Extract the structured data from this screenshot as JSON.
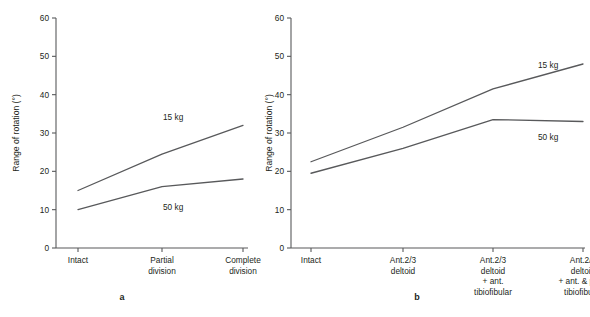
{
  "figure": {
    "panel_a_label": "a",
    "panel_b_label": "b"
  },
  "axes": {
    "ylabel": "Range of rotation (°)",
    "yticks": [
      "0",
      "10",
      "20",
      "30",
      "40",
      "50",
      "60"
    ]
  },
  "chart_data": [
    {
      "type": "line",
      "panel": "a",
      "title": "",
      "xlabel": "",
      "ylabel": "Range of rotation (°)",
      "ylim": [
        0,
        60
      ],
      "yticks": [
        0,
        10,
        20,
        30,
        40,
        50,
        60
      ],
      "grid": false,
      "legend_position": "inline-right",
      "categories": [
        "Intact",
        "Partial division",
        "Complete division"
      ],
      "category_lines": [
        [
          "Intact"
        ],
        [
          "Partial",
          "division"
        ],
        [
          "Complete",
          "division"
        ]
      ],
      "series": [
        {
          "name": "15 kg",
          "values": [
            15,
            24.5,
            32
          ]
        },
        {
          "name": "50 kg",
          "values": [
            10,
            16,
            18
          ]
        }
      ]
    },
    {
      "type": "line",
      "panel": "b",
      "title": "",
      "xlabel": "",
      "ylabel": "Range of rotation (°)",
      "ylim": [
        0,
        60
      ],
      "yticks": [
        0,
        10,
        20,
        30,
        40,
        50,
        60
      ],
      "grid": false,
      "legend_position": "inline-right",
      "categories": [
        "Intact",
        "Ant.2/3 deltoid",
        "Ant.2/3 deltoid + ant. tibiofibular",
        "Ant.2/3 deltoid + ant. & post. tibiofibular"
      ],
      "category_lines": [
        [
          "Intact"
        ],
        [
          "Ant.2/3",
          "deltoid"
        ],
        [
          "Ant.2/3",
          "deltoid",
          "+ ant.",
          "tibiofibular"
        ],
        [
          "Ant.2/3",
          "deltoid",
          "+ ant. & post.",
          "tibiofibular"
        ]
      ],
      "series": [
        {
          "name": "15 kg",
          "values": [
            22.5,
            31.5,
            41.5,
            48
          ]
        },
        {
          "name": "50 kg",
          "values": [
            19.5,
            26,
            33.5,
            33
          ]
        }
      ]
    }
  ]
}
